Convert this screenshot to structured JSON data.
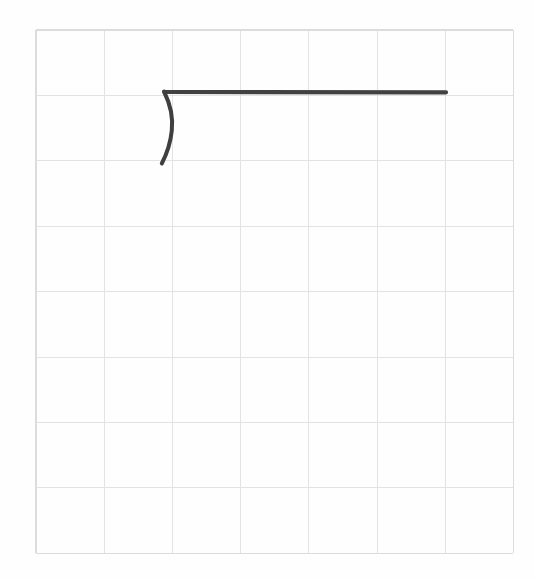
{
  "canvas": {
    "name": "handwriting-grid-canvas",
    "width": 534,
    "height": 579,
    "background_color": "#fefefe"
  },
  "grid": {
    "color": "#dcdcdc",
    "line_width": 1,
    "columns": 7,
    "rows": 8,
    "origin_x": 36,
    "origin_y": 30,
    "cell_width": 68.2,
    "cell_height": 65.4,
    "x_positions": [
      36,
      104.2,
      172.4,
      240.6,
      308.8,
      377,
      445.2,
      513.4
    ],
    "y_positions": [
      30,
      95.4,
      160.8,
      226.2,
      291.6,
      357,
      422.4,
      487.8,
      553.2
    ]
  },
  "strokes": [
    {
      "id": "stroke-horizontal-bar",
      "label": "horizontal-line",
      "color": "#414141",
      "width": 4.2,
      "path": "M 164.5 92.0 L 446.0 92.3",
      "start_point": [
        164.5,
        92
      ],
      "end_point": [
        446,
        92.3
      ]
    },
    {
      "id": "stroke-right-paren-arc",
      "label": "right-parenthesis-arc",
      "color": "#3f3f3f",
      "width": 4.0,
      "path": "M 164.0 91.5 C 170.5 104.5 173.2 117.5 171.8 130.5 C 170.6 142.5 167.2 153.0 161.8 163.5",
      "start_point": [
        164,
        91.5
      ],
      "end_point": [
        161.8,
        163.5
      ],
      "bulge_point": [
        172,
        126
      ]
    }
  ],
  "colors": {
    "ink": "#414141",
    "grid": "#dcdcdc",
    "background": "#fefefe"
  }
}
